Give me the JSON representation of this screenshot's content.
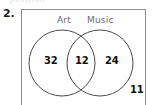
{
  "page": {
    "background_color": "#ffffff",
    "width": 152,
    "height": 105,
    "cutoff_text_above": "position"
  },
  "question": {
    "number_label": "2."
  },
  "diagram": {
    "type": "venn-diagram",
    "universe_border_color": "#8d8d8d",
    "circle_stroke_color": "#4a4a4a",
    "label_color": "#6b6b6b",
    "value_color": "#111111",
    "sets": [
      {
        "id": "art",
        "label": "Art"
      },
      {
        "id": "music",
        "label": "Music"
      }
    ],
    "regions": [
      {
        "id": "art-only",
        "label": "Art only",
        "value": "32"
      },
      {
        "id": "both",
        "label": "Art and Music",
        "value": "12"
      },
      {
        "id": "music-only",
        "label": "Music only",
        "value": "24"
      },
      {
        "id": "neither",
        "label": "Neither set",
        "value": "11"
      }
    ]
  }
}
